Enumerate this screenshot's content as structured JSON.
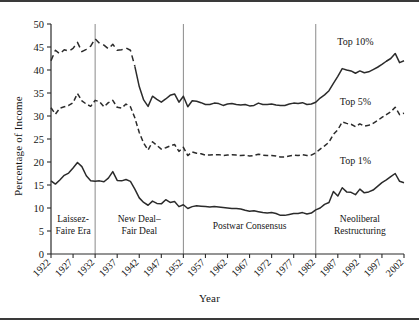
{
  "figure": {
    "x_axis_title": "Year",
    "y_axis_title": "Percentage of Income"
  },
  "chart_data": {
    "type": "line",
    "title": "",
    "xlabel": "Year",
    "ylabel": "Percentage of Income",
    "xlim": [
      1922,
      2002
    ],
    "ylim": [
      0,
      50
    ],
    "ytick_labels": [
      "0",
      "5",
      "10",
      "15",
      "20",
      "25",
      "30",
      "35",
      "40",
      "45",
      "50"
    ],
    "ytick_values": [
      0,
      5,
      10,
      15,
      20,
      25,
      30,
      35,
      40,
      45,
      50
    ],
    "xtick_labels": [
      "1922",
      "1927",
      "1932",
      "1937",
      "1942",
      "1947",
      "1952",
      "1957",
      "1962",
      "1967",
      "1972",
      "1977",
      "1982",
      "1987",
      "1992",
      "1997",
      "2002"
    ],
    "xtick_values": [
      1922,
      1927,
      1932,
      1937,
      1942,
      1947,
      1952,
      1957,
      1962,
      1967,
      1972,
      1977,
      1982,
      1987,
      1992,
      1997,
      2002
    ],
    "grid": false,
    "legend": "inline-annotations",
    "x": [
      1922,
      1923,
      1924,
      1925,
      1926,
      1927,
      1928,
      1929,
      1930,
      1931,
      1932,
      1933,
      1934,
      1935,
      1936,
      1937,
      1938,
      1939,
      1940,
      1941,
      1942,
      1943,
      1944,
      1945,
      1946,
      1947,
      1948,
      1949,
      1950,
      1951,
      1952,
      1953,
      1954,
      1955,
      1956,
      1957,
      1958,
      1959,
      1960,
      1961,
      1962,
      1963,
      1964,
      1965,
      1966,
      1967,
      1968,
      1969,
      1970,
      1971,
      1972,
      1973,
      1974,
      1975,
      1976,
      1977,
      1978,
      1979,
      1980,
      1981,
      1982,
      1983,
      1984,
      1985,
      1986,
      1987,
      1988,
      1989,
      1990,
      1991,
      1992,
      1993,
      1994,
      1995,
      1996,
      1997,
      1998,
      1999,
      2000,
      2001,
      2002
    ],
    "series": [
      {
        "name": "Top 10%",
        "style": "dashed-then-solid",
        "label": "Top 10%",
        "values": [
          42.0,
          44.3,
          43.5,
          44.4,
          44.1,
          44.7,
          46.0,
          44.0,
          44.5,
          45.2,
          46.8,
          45.8,
          45.4,
          44.6,
          45.6,
          44.3,
          44.4,
          44.8,
          44.3,
          40.8,
          36.4,
          33.5,
          32.1,
          34.3,
          33.6,
          33.0,
          33.7,
          34.5,
          34.8,
          33.0,
          34.3,
          32.0,
          33.3,
          33.2,
          32.9,
          32.5,
          32.5,
          32.8,
          32.7,
          32.3,
          32.6,
          32.7,
          32.5,
          32.4,
          32.5,
          32.2,
          32.3,
          32.8,
          32.5,
          32.5,
          32.6,
          32.4,
          32.3,
          32.3,
          32.6,
          32.8,
          32.7,
          32.9,
          32.5,
          32.6,
          33.0,
          33.9,
          34.6,
          35.5,
          37.1,
          38.6,
          40.3,
          40.0,
          39.8,
          39.3,
          39.8,
          39.4,
          39.6,
          40.1,
          40.6,
          41.2,
          41.9,
          42.5,
          43.6,
          41.6,
          42.0
        ]
      },
      {
        "name": "Top 5%",
        "style": "dashed",
        "label": "Top 5%",
        "values": [
          31.8,
          30.4,
          31.7,
          32.0,
          32.3,
          32.9,
          34.9,
          33.3,
          32.6,
          32.1,
          33.4,
          33.1,
          32.0,
          32.9,
          33.4,
          31.9,
          31.7,
          32.6,
          32.0,
          29.6,
          26.4,
          24.1,
          22.6,
          24.4,
          23.6,
          22.8,
          23.1,
          23.5,
          23.8,
          22.3,
          23.2,
          21.4,
          22.2,
          21.9,
          21.8,
          21.5,
          21.5,
          21.6,
          21.6,
          21.4,
          21.5,
          21.6,
          21.5,
          21.4,
          21.5,
          21.3,
          21.4,
          21.7,
          21.5,
          21.4,
          21.4,
          21.3,
          21.1,
          21.1,
          21.3,
          21.5,
          21.4,
          21.6,
          21.4,
          21.5,
          22.0,
          22.8,
          23.5,
          24.3,
          26.0,
          27.0,
          28.7,
          28.4,
          28.2,
          27.7,
          28.3,
          27.8,
          28.0,
          28.4,
          29.0,
          29.7,
          30.3,
          30.9,
          31.9,
          30.3,
          30.6
        ]
      },
      {
        "name": "Top 1%",
        "style": "solid",
        "label": "Top 1%",
        "values": [
          15.9,
          15.2,
          16.1,
          17.1,
          17.6,
          18.7,
          19.9,
          19.0,
          17.0,
          15.9,
          15.8,
          15.9,
          15.7,
          16.5,
          17.9,
          16.0,
          15.9,
          16.2,
          15.8,
          14.1,
          12.2,
          11.2,
          10.6,
          11.5,
          11.0,
          10.9,
          11.8,
          11.2,
          11.4,
          10.3,
          10.7,
          9.9,
          10.3,
          10.5,
          10.4,
          10.3,
          10.2,
          10.3,
          10.2,
          10.1,
          10.0,
          9.9,
          9.9,
          9.8,
          9.5,
          9.3,
          9.4,
          9.2,
          9.0,
          8.9,
          9.0,
          8.8,
          8.4,
          8.4,
          8.6,
          8.8,
          8.8,
          9.0,
          8.7,
          8.9,
          9.6,
          10.0,
          10.8,
          11.2,
          13.6,
          12.6,
          14.4,
          13.5,
          13.4,
          12.9,
          14.1,
          13.3,
          13.5,
          13.9,
          14.7,
          15.5,
          16.1,
          16.8,
          17.5,
          15.8,
          15.5
        ]
      }
    ],
    "era_bands": [
      {
        "label_line1": "Laissez-",
        "label_line2": "Faire Era",
        "start": 1922,
        "end": 1932
      },
      {
        "label_line1": "New Deal–",
        "label_line2": "Fair Deal",
        "start": 1932,
        "end": 1952
      },
      {
        "label_line1": "Postwar Consensus",
        "label_line2": "",
        "start": 1952,
        "end": 1982
      },
      {
        "label_line1": "Neoliberal",
        "label_line2": "Restructuring",
        "start": 1982,
        "end": 2002
      }
    ],
    "era_divider_years": [
      1932,
      1952,
      1982
    ],
    "annotations": [
      {
        "text": "Top 10%",
        "x": 1991,
        "y": 45.5
      },
      {
        "text": "Top 5%",
        "x": 1991,
        "y": 32.5
      },
      {
        "text": "Top 1%",
        "x": 1991,
        "y": 19.5
      }
    ],
    "colors": {
      "line": "#2b2b2b",
      "axis": "#2b2b2b",
      "divider": "#8a8a8a",
      "background": "#ffffff",
      "text": "#141414"
    }
  }
}
